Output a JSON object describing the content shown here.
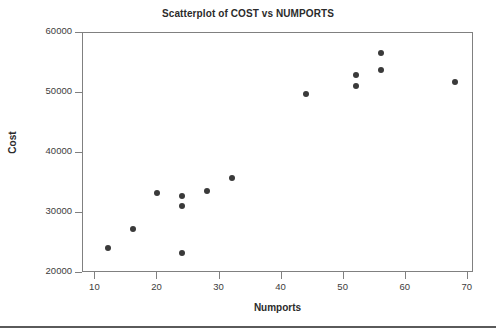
{
  "chart_data": {
    "type": "scatter",
    "title": "Scatterplot of COST vs NUMPORTS",
    "xlabel": "Numports",
    "ylabel": "Cost",
    "xlim": [
      8,
      71
    ],
    "ylim": [
      20000,
      60000
    ],
    "xticks": [
      10,
      20,
      30,
      40,
      50,
      60,
      70
    ],
    "yticks": [
      20000,
      30000,
      40000,
      50000,
      60000
    ],
    "xtick_labels": [
      "10",
      "20",
      "30",
      "40",
      "50",
      "60",
      "70"
    ],
    "ytick_labels": [
      "20000",
      "30000",
      "40000",
      "50000",
      "60000"
    ],
    "grid": false,
    "legend": false,
    "marker": "filled-circle",
    "marker_color": "#3a3a3a",
    "x": [
      12,
      16,
      20,
      24,
      24,
      24,
      28,
      32,
      44,
      52,
      52,
      56,
      56,
      68
    ],
    "y": [
      24200,
      27300,
      33300,
      23300,
      31100,
      32800,
      33700,
      35900,
      49900,
      51200,
      53000,
      53900,
      56700,
      51800
    ],
    "points": [
      {
        "x": 12,
        "y": 24200
      },
      {
        "x": 16,
        "y": 27300
      },
      {
        "x": 20,
        "y": 33300
      },
      {
        "x": 24,
        "y": 23300
      },
      {
        "x": 24,
        "y": 31100
      },
      {
        "x": 24,
        "y": 32800
      },
      {
        "x": 28,
        "y": 33700
      },
      {
        "x": 32,
        "y": 35900
      },
      {
        "x": 44,
        "y": 49900
      },
      {
        "x": 52,
        "y": 51200
      },
      {
        "x": 52,
        "y": 53000
      },
      {
        "x": 56,
        "y": 53900
      },
      {
        "x": 56,
        "y": 56700
      },
      {
        "x": 68,
        "y": 51800
      }
    ]
  }
}
